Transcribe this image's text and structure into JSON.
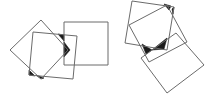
{
  "diagram": {
    "stroke_color": "#6b6b6b",
    "fill_color": "#1a1a1a",
    "background": "#ffffff",
    "figures": [
      {
        "name": "left-figure",
        "squares": [
          {
            "name": "diamond-square",
            "points": "41,20 68,50 41,79 10,50"
          },
          {
            "name": "tilted-square",
            "points": "33,32 77,36 73,79 29,75"
          },
          {
            "name": "upright-square",
            "points": "64,22 108,22 108,65 64,65"
          }
        ],
        "shaded": [
          {
            "name": "top-overlap",
            "points": "58,34 64,35 64,41"
          },
          {
            "name": "right-vertex",
            "points": "64,42 70,50 64,57"
          },
          {
            "name": "bottom-left-overlap",
            "points": "29,70 35,76 29,75"
          },
          {
            "name": "bottom-vertex",
            "points": "36,75 41,79 44,78"
          }
        ]
      },
      {
        "name": "right-figure",
        "squares": [
          {
            "name": "top-square",
            "points": "132,1 174,7 167,50 125,43"
          },
          {
            "name": "rotated-square",
            "points": "129,25 167,5 187,42 149,62"
          },
          {
            "name": "bottom-square",
            "points": "141,58 176,33 204,65 167,93"
          }
        ],
        "shaded": [
          {
            "name": "top-right-overlap",
            "points": "164,4 171,6 169,10"
          },
          {
            "name": "right-edge-overlap",
            "points": "172,9 174,7 173,14"
          },
          {
            "name": "left-bulge",
            "points": "142,44 152,50 146,54"
          },
          {
            "name": "center-bulge",
            "points": "152,50 167,38 164,49"
          }
        ]
      }
    ]
  }
}
